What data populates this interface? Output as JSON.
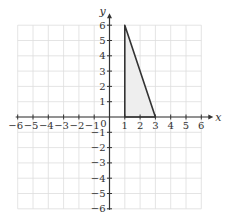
{
  "chart_data": {
    "type": "diagram",
    "title": "",
    "xlabel": "x",
    "ylabel": "y",
    "xlim": [
      -6,
      6
    ],
    "ylim": [
      -6,
      6
    ],
    "grid": true,
    "x_ticks": [
      -6,
      -5,
      -4,
      -3,
      -2,
      -1,
      1,
      2,
      3,
      4,
      5,
      6
    ],
    "y_ticks": [
      -6,
      -5,
      -4,
      -3,
      -2,
      -1,
      1,
      2,
      3,
      4,
      5,
      6
    ],
    "origin_label": "0",
    "shapes": [
      {
        "name": "triangle",
        "vertices": [
          [
            1,
            6
          ],
          [
            1,
            0
          ],
          [
            3,
            0
          ]
        ],
        "fill": "#eeeeee",
        "stroke": "#333333"
      }
    ]
  },
  "colors": {
    "grid": "#dddddd",
    "axis": "#333333",
    "fill": "#eeeeee"
  }
}
